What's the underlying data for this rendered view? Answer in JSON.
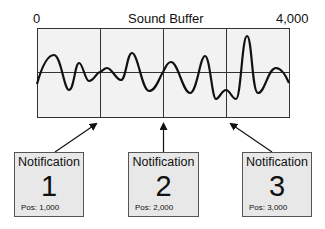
{
  "title": "Sound Buffer",
  "axis": {
    "start_label": "0",
    "end_label": "4,000"
  },
  "colors": {
    "box_fill": "#e8e8e8",
    "buffer_fill": "#f2f2f2",
    "line": "#111111"
  },
  "notifications": [
    {
      "label": "Notification",
      "number": "1",
      "position": "Pos: 1,000"
    },
    {
      "label": "Notification",
      "number": "2",
      "position": "Pos: 2,000"
    },
    {
      "label": "Notification",
      "number": "3",
      "position": "Pos: 3,000"
    }
  ]
}
